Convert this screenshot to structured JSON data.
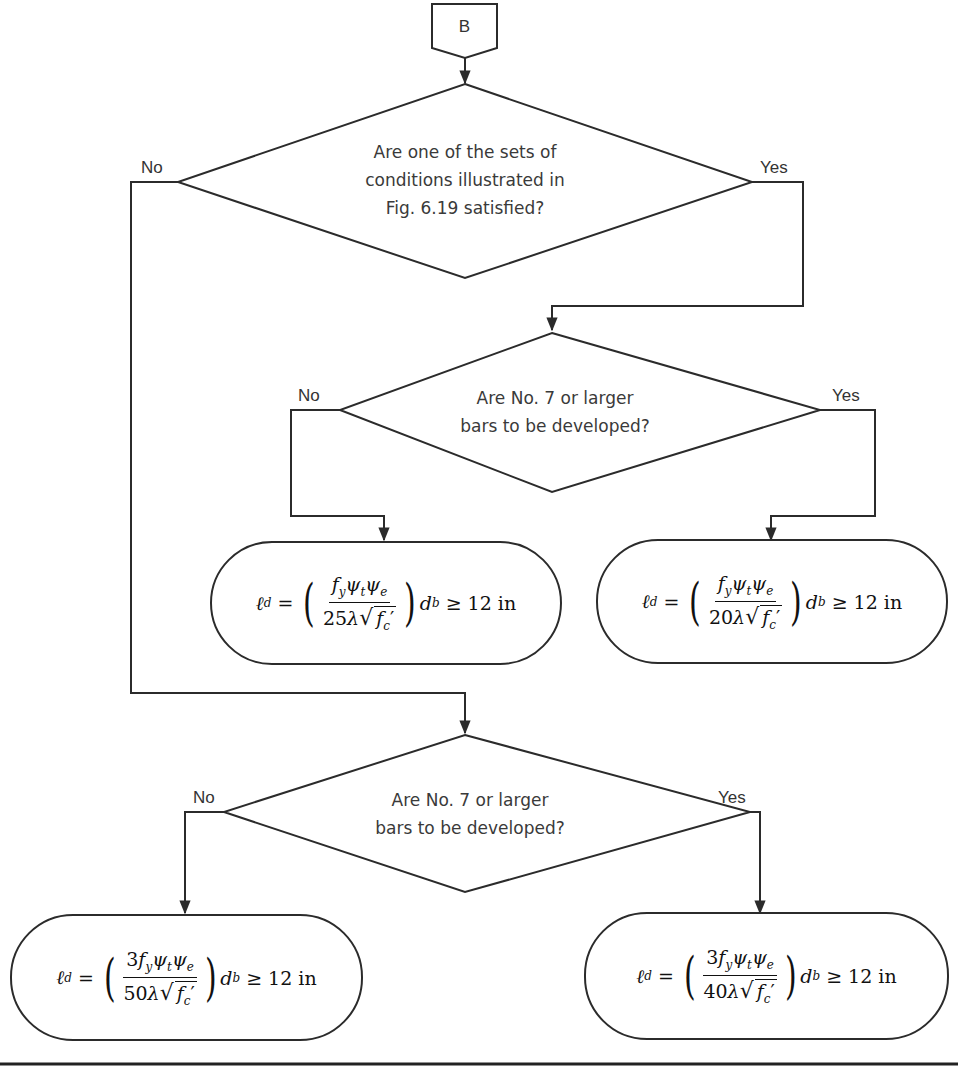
{
  "diagram": {
    "type": "flowchart",
    "connector": {
      "label": "B"
    },
    "decisions": [
      {
        "id": "d1",
        "question_lines": [
          "Are one of the sets of",
          "conditions illustrated in",
          "Fig. 6.19 satisfied?"
        ],
        "no_label": "No",
        "yes_label": "Yes"
      },
      {
        "id": "d2",
        "question_lines": [
          "Are No. 7 or larger",
          "bars to be developed?"
        ],
        "no_label": "No",
        "yes_label": "Yes"
      },
      {
        "id": "d3",
        "question_lines": [
          "Are No. 7 or larger",
          "bars to be developed?"
        ],
        "no_label": "No",
        "yes_label": "Yes"
      }
    ],
    "results": [
      {
        "id": "r1",
        "lhs": "ℓ",
        "lhs_sub": "d",
        "coef": "",
        "denominator_const": "25",
        "rhs": "≥ 12 in",
        "text": "ℓd = (fy ψt ψe / (25λ√f'c)) db ≥ 12 in"
      },
      {
        "id": "r2",
        "lhs": "ℓ",
        "lhs_sub": "d",
        "coef": "",
        "denominator_const": "20",
        "rhs": "≥ 12 in",
        "text": "ℓd = (fy ψt ψe / (20λ√f'c)) db ≥ 12 in"
      },
      {
        "id": "r3",
        "lhs": "ℓ",
        "lhs_sub": "d",
        "coef": "3",
        "denominator_const": "50",
        "rhs": "≥ 12 in",
        "text": "ℓd = (3fy ψt ψe / (50λ√f'c)) db ≥ 12 in"
      },
      {
        "id": "r4",
        "lhs": "ℓ",
        "lhs_sub": "d",
        "coef": "3",
        "denominator_const": "40",
        "rhs": "≥ 12 in",
        "text": "ℓd = (3fy ψt ψe / (40λ√f'c)) db ≥ 12 in"
      }
    ],
    "edges": [
      {
        "from": "B",
        "to": "d1"
      },
      {
        "from": "d1",
        "to": "d2",
        "label": "Yes"
      },
      {
        "from": "d1",
        "to": "d3",
        "label": "No"
      },
      {
        "from": "d2",
        "to": "r1",
        "label": "No"
      },
      {
        "from": "d2",
        "to": "r2",
        "label": "Yes"
      },
      {
        "from": "d3",
        "to": "r3",
        "label": "No"
      },
      {
        "from": "d3",
        "to": "r4",
        "label": "Yes"
      }
    ],
    "symbols": {
      "eq": "=",
      "fy": "f",
      "fy_sub": "y",
      "psi": "ψ",
      "psi_t_sub": "t",
      "psi_e_sub": "e",
      "lambda": "λ",
      "sqrt": "√",
      "fc": "f",
      "fc_sub": "c",
      "prime": "′",
      "db": "d",
      "db_sub": "b"
    },
    "colors": {
      "line": "#2b2b2b",
      "text": "#333333",
      "background": "#ffffff"
    }
  }
}
